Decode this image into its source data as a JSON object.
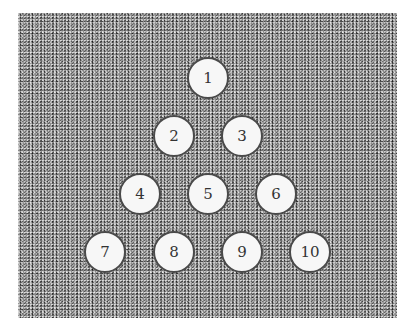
{
  "diagram": {
    "type": "triangle-arrangement",
    "background": "noise-texture",
    "balls": [
      {
        "label": "1",
        "x": 208,
        "y": 78
      },
      {
        "label": "2",
        "x": 174,
        "y": 136
      },
      {
        "label": "3",
        "x": 242,
        "y": 136
      },
      {
        "label": "4",
        "x": 140,
        "y": 194
      },
      {
        "label": "5",
        "x": 208,
        "y": 194
      },
      {
        "label": "6",
        "x": 276,
        "y": 194
      },
      {
        "label": "7",
        "x": 105,
        "y": 252
      },
      {
        "label": "8",
        "x": 174,
        "y": 252
      },
      {
        "label": "9",
        "x": 242,
        "y": 252
      },
      {
        "label": "10",
        "x": 310,
        "y": 252
      }
    ]
  }
}
